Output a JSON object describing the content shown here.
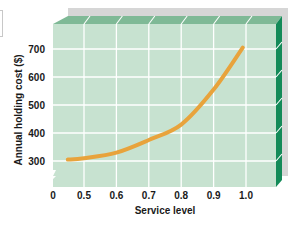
{
  "chart_data": {
    "type": "line",
    "title": "",
    "xlabel": "Service level",
    "ylabel": "Annual holding cost ($)",
    "x_ticks": [
      "0",
      "0.5",
      "0.6",
      "0.7",
      "0.8",
      "0.9",
      "1.0"
    ],
    "y_ticks": [
      "300",
      "400",
      "500",
      "600",
      "700"
    ],
    "xlim": [
      0.4,
      1.1
    ],
    "ylim": [
      210,
      780
    ],
    "axis_break": {
      "x": true,
      "y": true
    },
    "grid": true,
    "legend": null,
    "series": [
      {
        "name": "Annual holding cost",
        "color": "#e8a33c",
        "x": [
          0.45,
          0.5,
          0.6,
          0.7,
          0.8,
          0.9,
          0.99
        ],
        "y": [
          305,
          310,
          330,
          375,
          430,
          555,
          705
        ]
      }
    ],
    "style": {
      "front_face": "#c7e2d0",
      "top_face": "#7fb996",
      "side_face": "#138a58",
      "back_panel": "#d3d3d3",
      "grid_color": "#ffffff"
    }
  }
}
